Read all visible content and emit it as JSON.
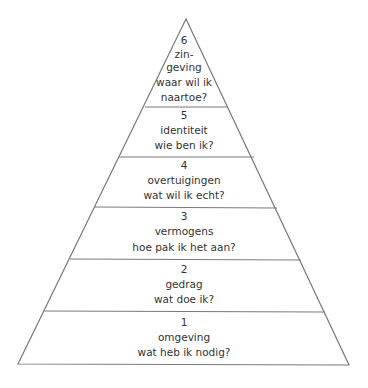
{
  "diagram": {
    "type": "pyramid",
    "line_color": "#7a7a7a",
    "text_color": "#333333",
    "levels": [
      {
        "number": "6",
        "title_lines": [
          "zin-",
          "geving"
        ],
        "question": "waar wil ik",
        "question_line2": "naartoe?"
      },
      {
        "number": "5",
        "title": "identiteit",
        "question": "wie ben ik?"
      },
      {
        "number": "4",
        "title": "overtuigingen",
        "question": "wat wil ik echt?"
      },
      {
        "number": "3",
        "title": "vermogens",
        "question": "hoe pak ik het aan?"
      },
      {
        "number": "2",
        "title": "gedrag",
        "question": "wat doe ik?"
      },
      {
        "number": "1",
        "title": "omgeving",
        "question": "wat heb ik nodig?"
      }
    ]
  }
}
